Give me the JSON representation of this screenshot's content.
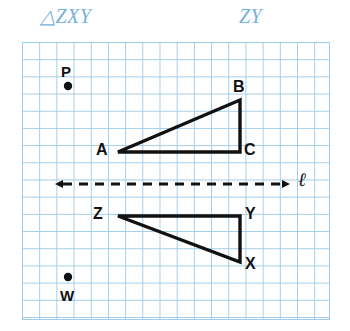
{
  "header": {
    "triangle_label": "△ZXY",
    "segment_label": "ZY",
    "color": "#74b2dc"
  },
  "grid": {
    "cell_size_px": 17.2,
    "line_color": "#9ecbe8",
    "background": "#ffffff",
    "x": 22,
    "y": 42,
    "width": 308,
    "height": 278
  },
  "figure": {
    "stroke_color": "#111111",
    "line_of_reflection": {
      "name": "ℓ",
      "label": "ℓ",
      "style": "dashed-double-arrow",
      "y": 184,
      "x_start": 55,
      "x_end": 290
    },
    "points": [
      {
        "label": "P",
        "dot_x": 68,
        "dot_y": 86,
        "label_x": 61,
        "label_y": 64,
        "dot_position": "below-label"
      },
      {
        "label": "W",
        "dot_x": 68,
        "dot_y": 277,
        "label_x": 60,
        "label_y": 288,
        "dot_position": "above-label"
      }
    ],
    "triangles": [
      {
        "name": "ABC",
        "position": "above-line",
        "vertices": [
          {
            "label": "A",
            "x": 118,
            "y": 152
          },
          {
            "label": "B",
            "x": 240,
            "y": 100
          },
          {
            "label": "C",
            "x": 240,
            "y": 152
          }
        ]
      },
      {
        "name": "ZXY",
        "position": "below-line",
        "vertices": [
          {
            "label": "Z",
            "x": 118,
            "y": 216
          },
          {
            "label": "Y",
            "x": 240,
            "y": 216
          },
          {
            "label": "X",
            "x": 240,
            "y": 262
          }
        ]
      }
    ],
    "labels": {
      "P": "P",
      "W": "W",
      "A": "A",
      "B": "B",
      "C": "C",
      "Z": "Z",
      "X": "X",
      "Y": "Y",
      "line": "ℓ"
    }
  }
}
